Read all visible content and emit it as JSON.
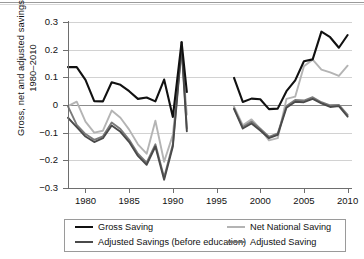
{
  "chart_data": {
    "type": "line",
    "title": "",
    "xlabel": "",
    "ylabel": "Gross, net and adjusted savings 1980–2010",
    "ylabel_line1": "Gross, net and adjusted savings",
    "ylabel_line2": "1980–2010",
    "xlim": [
      1978,
      2010.5
    ],
    "ylim": [
      -0.3,
      0.3
    ],
    "xticks": [
      1980,
      1985,
      1990,
      1995,
      2000,
      2005,
      2010
    ],
    "xticklabels": [
      "1980",
      "1985",
      "1990",
      "1995",
      "2000",
      "2005",
      "2010"
    ],
    "yticks": [
      0.3,
      0.2,
      0.1,
      0,
      -0.1,
      -0.2,
      -0.3
    ],
    "yticklabels": [
      "0.3",
      "0.2",
      "0.1",
      "0",
      "−0.1",
      "−0.2",
      "−0.3"
    ],
    "grid": true,
    "legend_position": "bottom",
    "note": "Data shown in two segments with a gap between 1991 and 1997",
    "series": [
      {
        "name": "Gross Saving",
        "color": "#111111",
        "width": 2.1,
        "segments": [
          {
            "x": [
              1978,
              1979,
              1980,
              1981,
              1982,
              1983,
              1984,
              1985,
              1986,
              1987,
              1988,
              1989,
              1990,
              1991
            ],
            "y": [
              0.137,
              0.137,
              0.091,
              0.014,
              0.013,
              0.082,
              0.073,
              0.05,
              0.022,
              0.027,
              0.013,
              0.092,
              -0.043,
              0.227
            ]
          },
          {
            "x": [
              1991,
              1991.6
            ],
            "y": [
              0.227,
              0.047
            ]
          },
          {
            "x": [
              1997,
              1998,
              1999,
              2000,
              2001,
              2002,
              2003,
              2004,
              2005,
              2006,
              2007,
              2008,
              2009,
              2010
            ],
            "y": [
              0.098,
              0.011,
              0.023,
              0.021,
              -0.015,
              -0.013,
              0.05,
              0.089,
              0.158,
              0.165,
              0.265,
              0.245,
              0.207,
              0.253
            ]
          }
        ]
      },
      {
        "name": "Adjusted Savings (before education)",
        "color": "#4a4a4a",
        "width": 1.9,
        "segments": [
          {
            "x": [
              1978,
              1979,
              1980,
              1981,
              1982,
              1983,
              1984,
              1985,
              1986,
              1987,
              1988,
              1989,
              1990,
              1991
            ],
            "y": [
              -0.046,
              -0.08,
              -0.114,
              -0.134,
              -0.12,
              -0.074,
              -0.097,
              -0.134,
              -0.184,
              -0.216,
              -0.15,
              -0.27,
              -0.15,
              0.207
            ]
          },
          {
            "x": [
              1991,
              1991.6
            ],
            "y": [
              0.207,
              -0.095
            ]
          },
          {
            "x": [
              1997,
              1998,
              1999,
              2000,
              2001,
              2002,
              2003,
              2004,
              2005,
              2006,
              2007,
              2008,
              2009,
              2010
            ],
            "y": [
              -0.014,
              -0.085,
              -0.067,
              -0.092,
              -0.12,
              -0.108,
              -0.01,
              0.012,
              0.01,
              0.022,
              0.006,
              -0.007,
              -0.004,
              -0.042
            ]
          }
        ]
      },
      {
        "name": "Net National Saving",
        "color": "#b4b4b4",
        "width": 1.9,
        "segments": [
          {
            "x": [
              1978,
              1979,
              1980,
              1981,
              1982,
              1983,
              1984,
              1985,
              1986,
              1987,
              1988,
              1989,
              1990,
              1991
            ],
            "y": [
              -0.004,
              0.012,
              -0.06,
              -0.1,
              -0.093,
              -0.02,
              -0.046,
              -0.089,
              -0.142,
              -0.176,
              -0.057,
              -0.205,
              -0.108,
              0.197
            ]
          },
          {
            "x": [
              1991,
              1991.6
            ],
            "y": [
              0.197,
              -0.035
            ]
          },
          {
            "x": [
              1997,
              1998,
              1999,
              2000,
              2001,
              2002,
              2003,
              2004,
              2005,
              2006,
              2007,
              2008,
              2009,
              2010
            ],
            "y": [
              -0.006,
              -0.073,
              -0.052,
              -0.086,
              -0.128,
              -0.12,
              0.022,
              0.03,
              0.14,
              0.164,
              0.128,
              0.118,
              0.105,
              0.142
            ]
          }
        ]
      },
      {
        "name": "Adjusted Saving",
        "color": "#7a7a7a",
        "width": 1.9,
        "segments": [
          {
            "x": [
              1978,
              1979,
              1980,
              1981,
              1982,
              1983,
              1984,
              1985,
              1986,
              1987,
              1988,
              1989,
              1990,
              1991
            ],
            "y": [
              -0.005,
              -0.072,
              -0.105,
              -0.126,
              -0.113,
              -0.063,
              -0.087,
              -0.126,
              -0.176,
              -0.208,
              -0.142,
              -0.262,
              -0.142,
              0.216
            ]
          },
          {
            "x": [
              1991,
              1991.6
            ],
            "y": [
              0.216,
              -0.085
            ]
          },
          {
            "x": [
              1997,
              1998,
              1999,
              2000,
              2001,
              2002,
              2003,
              2004,
              2005,
              2006,
              2007,
              2008,
              2009,
              2010
            ],
            "y": [
              -0.012,
              -0.08,
              -0.06,
              -0.086,
              -0.115,
              -0.103,
              -0.004,
              0.018,
              0.016,
              0.028,
              0.01,
              -0.001,
              0.0,
              -0.036
            ]
          }
        ]
      }
    ]
  },
  "legend": {
    "entries": [
      {
        "label": "Gross Saving",
        "color": "#111111"
      },
      {
        "label": "Net National Saving",
        "color": "#b4b4b4"
      },
      {
        "label": "Adjusted Savings (before education)",
        "color": "#4a4a4a"
      },
      {
        "label": "Adjusted Saving",
        "color": "#7a7a7a"
      }
    ]
  }
}
